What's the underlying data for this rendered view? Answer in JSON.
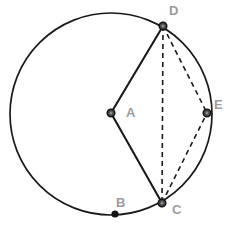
{
  "figure": {
    "type": "circle-geometry-diagram",
    "background_color": "#ffffff",
    "stroke_color": "#1a1a1a",
    "label_color": "#9c9c9c",
    "point_fill_color": "#4a4a4a",
    "point_stroke_color": "#141414"
  },
  "circle": {
    "name": "main-circle",
    "center_label": "A",
    "cx": 111,
    "cy": 114,
    "r": 101,
    "stroke_width": 1.7,
    "style": "solid"
  },
  "points": [
    {
      "id": "A",
      "label": "A",
      "x": 111,
      "y": 113,
      "label_x": 126,
      "label_y": 117,
      "on_circle": false,
      "role": "center",
      "marker": "ring"
    },
    {
      "id": "B",
      "label": "B",
      "x": 115,
      "y": 214,
      "label_x": 116,
      "label_y": 207,
      "on_circle": true,
      "role": "arc-point",
      "marker": "dot"
    },
    {
      "id": "C",
      "label": "C",
      "x": 162,
      "y": 203,
      "label_x": 172,
      "label_y": 214,
      "on_circle": true,
      "role": "vertex",
      "marker": "ring"
    },
    {
      "id": "D",
      "label": "D",
      "x": 163,
      "y": 26,
      "label_x": 169,
      "label_y": 15,
      "on_circle": true,
      "role": "vertex",
      "marker": "ring"
    },
    {
      "id": "E",
      "label": "E",
      "x": 207,
      "y": 113,
      "label_x": 214,
      "label_y": 109,
      "on_circle": true,
      "role": "vertex",
      "marker": "ring"
    }
  ],
  "segments": [
    {
      "id": "AD",
      "from": "A",
      "to": "D",
      "style": "solid",
      "x1": 111,
      "y1": 113,
      "x2": 163,
      "y2": 26,
      "stroke_width": 2.1
    },
    {
      "id": "AC",
      "from": "A",
      "to": "C",
      "style": "solid",
      "x1": 111,
      "y1": 113,
      "x2": 162,
      "y2": 203,
      "stroke_width": 2.1
    },
    {
      "id": "DC",
      "from": "D",
      "to": "C",
      "style": "dashed",
      "x1": 163,
      "y1": 26,
      "x2": 162,
      "y2": 203,
      "stroke_width": 1.6,
      "dash": "5,4"
    },
    {
      "id": "DE",
      "from": "D",
      "to": "E",
      "style": "dashed",
      "x1": 163,
      "y1": 26,
      "x2": 207,
      "y2": 113,
      "stroke_width": 1.6,
      "dash": "5,4"
    },
    {
      "id": "CE",
      "from": "C",
      "to": "E",
      "style": "dashed",
      "x1": 162,
      "y1": 203,
      "x2": 207,
      "y2": 113,
      "stroke_width": 1.6,
      "dash": "5,4"
    }
  ],
  "labels": {
    "A": "A",
    "B": "B",
    "C": "C",
    "D": "D",
    "E": "E"
  }
}
